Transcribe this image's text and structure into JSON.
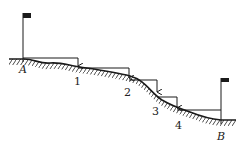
{
  "diagram": {
    "points": [
      {
        "id": "A",
        "label": "A",
        "flag": true
      },
      {
        "id": "1",
        "label": "1"
      },
      {
        "id": "2",
        "label": "2"
      },
      {
        "id": "3",
        "label": "3"
      },
      {
        "id": "4",
        "label": "4"
      },
      {
        "id": "B",
        "label": "B",
        "flag": true
      }
    ],
    "colors": {
      "line": "#1a1a1a",
      "background": "#ffffff"
    }
  }
}
